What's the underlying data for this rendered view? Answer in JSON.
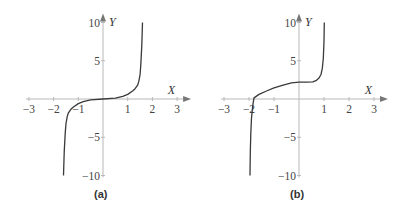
{
  "figures": [
    {
      "id": "a",
      "caption": "(a)"
    },
    {
      "id": "b",
      "caption": "(b)"
    }
  ],
  "chart_data": [
    {
      "type": "line",
      "title": "(a)",
      "xlabel": "X",
      "ylabel": "Y",
      "xlim": [
        -3,
        3
      ],
      "ylim": [
        -10,
        10
      ],
      "x_ticks": [
        -3,
        -2,
        -1,
        1,
        2,
        3
      ],
      "x_tick_labels": [
        "−3",
        "−2",
        "−1",
        "1",
        "2",
        "3"
      ],
      "y_ticks": [
        10,
        5,
        -5,
        -10
      ],
      "y_tick_labels": [
        "10",
        "5",
        "−5",
        "−10"
      ],
      "grid": false,
      "legend": null,
      "series": [
        {
          "name": "curve-a",
          "x": [
            -1.6,
            -1.57,
            -1.53,
            -1.5,
            -1.45,
            -1.4,
            -1.3,
            -1.2,
            -1.0,
            -0.8,
            -0.5,
            0,
            0.5,
            0.8,
            1.0,
            1.2,
            1.3,
            1.4,
            1.45,
            1.5,
            1.53,
            1.57,
            1.6
          ],
          "y": [
            -10,
            -7,
            -4.5,
            -3.2,
            -2.3,
            -1.8,
            -1.35,
            -1.05,
            -0.6,
            -0.35,
            -0.12,
            0,
            0.12,
            0.35,
            0.6,
            1.05,
            1.35,
            1.8,
            2.3,
            3.2,
            4.5,
            7,
            10
          ]
        }
      ]
    },
    {
      "type": "line",
      "title": "(b)",
      "xlabel": "X",
      "ylabel": "Y",
      "xlim": [
        -3,
        3
      ],
      "ylim": [
        -10,
        10
      ],
      "x_ticks": [
        -3,
        -2,
        -1,
        1,
        2,
        3
      ],
      "x_tick_labels": [
        "−3",
        "−2",
        "−1",
        "1",
        "2",
        "3"
      ],
      "y_ticks": [
        10,
        5,
        -5,
        -10
      ],
      "y_tick_labels": [
        "10",
        "5",
        "−5",
        "−10"
      ],
      "grid": false,
      "legend": null,
      "series": [
        {
          "name": "curve-b",
          "x": [
            -1.96,
            -1.95,
            -1.93,
            -1.9,
            -1.85,
            -1.8,
            -1.6,
            -1.3,
            -1.0,
            -0.6,
            -0.3,
            0,
            0.3,
            0.55,
            0.7,
            0.8,
            0.88,
            0.93,
            0.97,
            1.0,
            1.01
          ],
          "y": [
            -10,
            -7,
            -4.5,
            -2.5,
            -0.8,
            0.15,
            0.6,
            1.05,
            1.45,
            1.85,
            2.1,
            2.2,
            2.2,
            2.25,
            2.45,
            2.75,
            3.2,
            4.0,
            5.3,
            7.5,
            10
          ]
        }
      ]
    }
  ],
  "colors": {
    "axis": "#b8b8b8",
    "curve": "#3a3a3a",
    "text": "#444444"
  }
}
